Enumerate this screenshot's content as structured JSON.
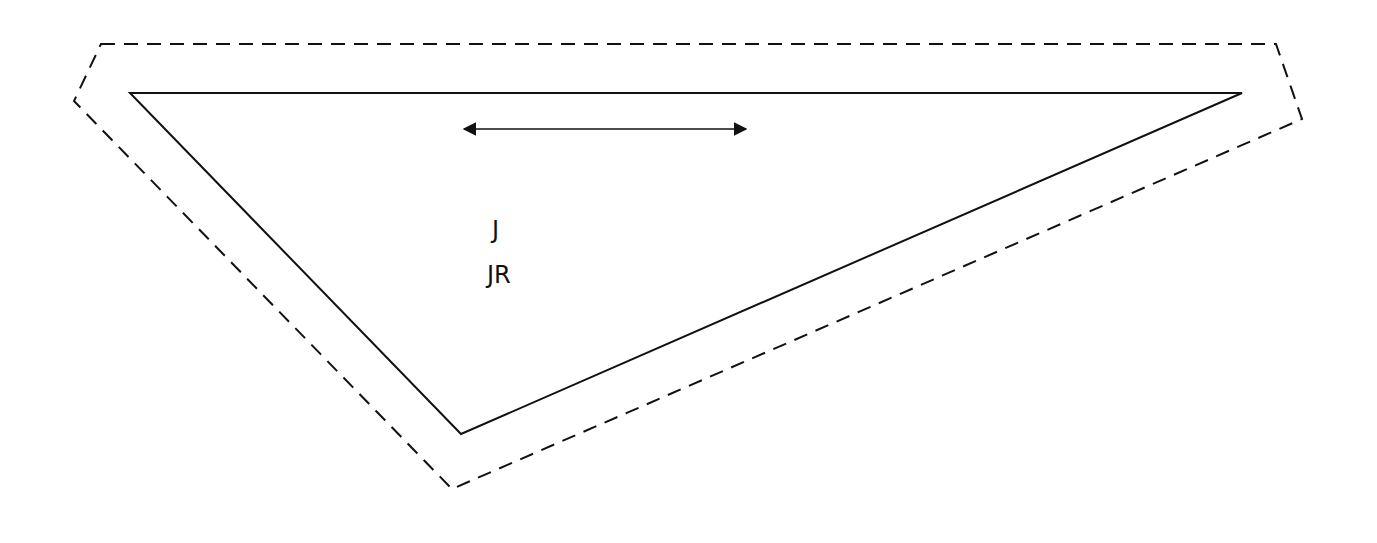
{
  "diagram": {
    "outer_boundary": {
      "style": "dashed",
      "points": [
        [
          101,
          44
        ],
        [
          1276,
          44
        ],
        [
          1302,
          119
        ],
        [
          452,
          489
        ],
        [
          74,
          101
        ]
      ]
    },
    "triangle": {
      "style": "solid",
      "points": [
        [
          130,
          93
        ],
        [
          1242,
          93
        ],
        [
          461,
          434
        ]
      ]
    },
    "arrow": {
      "type": "double-headed",
      "from": [
        462,
        129
      ],
      "to": [
        748,
        129
      ]
    },
    "labels": [
      {
        "text": "J",
        "x": 492,
        "y": 218
      },
      {
        "text": "JR",
        "x": 487,
        "y": 263
      }
    ],
    "colors": {
      "stroke": "#111111",
      "background": "#ffffff"
    }
  }
}
